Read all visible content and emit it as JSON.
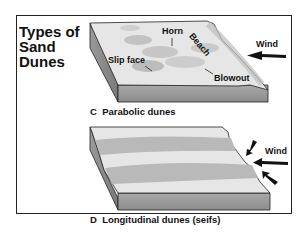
{
  "figure": {
    "copyright_note": "",
    "title_lines": [
      "Types of",
      "Sand",
      "Dunes"
    ]
  },
  "panel_c": {
    "letter": "C",
    "caption": "Parabolic dunes",
    "labels": {
      "horn": "Horn",
      "beach": "Beach",
      "slip_face": "Slip face",
      "blowout": "Blowout",
      "wind": "Wind"
    }
  },
  "panel_d": {
    "letter": "D",
    "caption": "Longitudinal dunes (seifs)",
    "labels": {
      "wind": "Wind"
    }
  },
  "colors": {
    "frame": "#222222",
    "surface": "#e4e4e4",
    "dune": "#b8b8b8",
    "side": "#9a9a9a",
    "arrow": "#111111"
  }
}
